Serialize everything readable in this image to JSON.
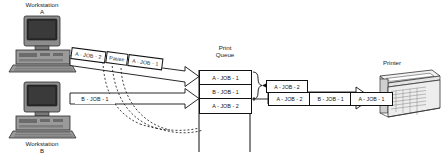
{
  "diagram": {
    "nodes": {
      "workstation_a": {
        "label_line1": "Workstation",
        "label_line2": "A",
        "icon": "desktop-computer-icon"
      },
      "workstation_b": {
        "label_line1": "Workstation",
        "label_line2": "B",
        "icon": "desktop-computer-icon"
      },
      "print_queue": {
        "label_line1": "Print",
        "label_line2": "Queue"
      },
      "printer": {
        "label": "Printer",
        "icon": "laser-printer-icon"
      }
    },
    "stream_a": [
      {
        "label": "A - JOB - 2"
      },
      {
        "label": "Pause"
      },
      {
        "label": "A - JOB - 1"
      }
    ],
    "stream_b": [
      {
        "label": "B - JOB - 1"
      }
    ],
    "queue_items": [
      {
        "label": "A - JOB - 1"
      },
      {
        "label": "B - JOB - 1"
      },
      {
        "label": "A - JOB - 2"
      }
    ],
    "queue_callout": {
      "label": "A - JOB - 2"
    },
    "output_stream": [
      {
        "label": "A - JOB - 2"
      },
      {
        "label": "B - JOB - 1"
      },
      {
        "label": "A - JOB - 1"
      }
    ],
    "colors": {
      "ink": "#111111",
      "paper": "#ffffff",
      "device_body": "#8d8d8d",
      "device_shade": "#6b6b6b",
      "screen": "#2b2b2b"
    }
  }
}
